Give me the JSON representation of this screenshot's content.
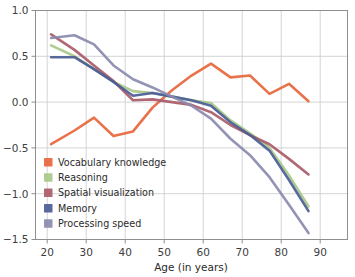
{
  "chart_data": {
    "type": "line",
    "title": "",
    "xlabel": "Age (in years)",
    "ylabel": "",
    "xlim": [
      17,
      97
    ],
    "ylim": [
      -1.5,
      1.0
    ],
    "xticks": [
      20,
      30,
      40,
      50,
      60,
      70,
      80,
      90
    ],
    "yticks": [
      1.0,
      0.5,
      0.0,
      -0.5,
      -1.0,
      -1.5
    ],
    "xtick_labels": [
      "20",
      "30",
      "40",
      "50",
      "60",
      "70",
      "80",
      "90"
    ],
    "ytick_labels": [
      "1.0",
      "0.5",
      "0.0",
      "-0.5",
      "-1.0",
      "-1.5"
    ],
    "grid": true,
    "legend_position": "lower left",
    "x": [
      21,
      27,
      32,
      37,
      42,
      47,
      52,
      57,
      62,
      67,
      72,
      77,
      82,
      87
    ],
    "series": [
      {
        "name": "Vocabulary knowledge",
        "color": "#e8663c",
        "values": [
          -0.46,
          -0.31,
          -0.17,
          -0.37,
          -0.32,
          -0.06,
          0.13,
          0.29,
          0.42,
          0.27,
          0.29,
          0.09,
          0.2,
          0.01
        ]
      },
      {
        "name": "Reasoning",
        "color": "#a8c98a",
        "values": [
          0.62,
          0.5,
          0.36,
          0.22,
          0.12,
          0.1,
          0.06,
          0.02,
          -0.01,
          -0.2,
          -0.34,
          -0.5,
          -0.8,
          -1.14
        ]
      },
      {
        "name": "Spatial visualization",
        "color": "#a85b68",
        "values": [
          0.74,
          0.57,
          0.4,
          0.23,
          0.02,
          0.03,
          0.0,
          -0.03,
          -0.11,
          -0.25,
          -0.36,
          -0.46,
          -0.62,
          -0.79
        ]
      },
      {
        "name": "Memory",
        "color": "#4a5c96",
        "values": [
          0.49,
          0.49,
          0.36,
          0.22,
          0.07,
          0.1,
          0.06,
          0.02,
          -0.04,
          -0.22,
          -0.36,
          -0.53,
          -0.85,
          -1.19
        ]
      },
      {
        "name": "Processing speed",
        "color": "#8a8ab0",
        "values": [
          0.7,
          0.73,
          0.63,
          0.4,
          0.25,
          0.16,
          0.06,
          -0.04,
          -0.18,
          -0.4,
          -0.58,
          -0.82,
          -1.12,
          -1.43
        ]
      }
    ]
  },
  "legend": {
    "items": [
      {
        "label": "Vocabulary knowledge",
        "color": "#e8663c"
      },
      {
        "label": "Reasoning",
        "color": "#a8c98a"
      },
      {
        "label": "Spatial visualization",
        "color": "#a85b68"
      },
      {
        "label": "Memory",
        "color": "#4a5c96"
      },
      {
        "label": "Processing speed",
        "color": "#8a8ab0"
      }
    ]
  }
}
